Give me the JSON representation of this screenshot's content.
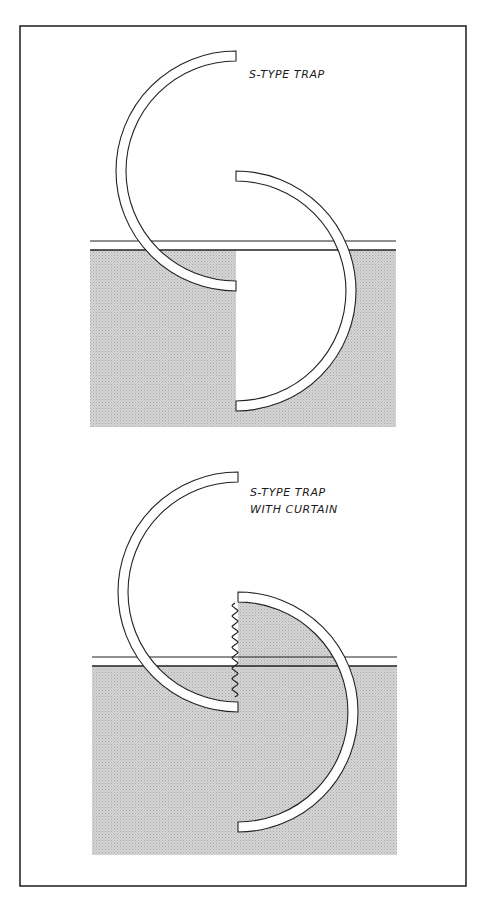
{
  "figure": {
    "frame": {
      "x": 20,
      "y": 26,
      "width": 446,
      "height": 860,
      "stroke": "#2a2a2a"
    },
    "colors": {
      "ink": "#222222",
      "soil_fill": "#d3d3d3",
      "soil_dot": "#a8a8a8",
      "pipe_fill": "#ffffff",
      "background": "#ffffff"
    },
    "panels": [
      {
        "id": "s-type-trap",
        "label_lines": [
          "S-TYPE TRAP"
        ],
        "label_pos": {
          "x": 249,
          "y": 66
        },
        "upper_arc": {
          "cx": 236,
          "cy": 171,
          "r_outer": 120,
          "r_inner": 110
        },
        "lower_arc": {
          "cx": 236,
          "cy": 291,
          "r_outer": 120,
          "r_inner": 110
        },
        "ground": {
          "line_y": 241,
          "soil_top": 250,
          "soil_bottom": 427,
          "left": 90,
          "right": 396
        },
        "curtain": false
      },
      {
        "id": "s-type-trap-with-curtain",
        "label_lines": [
          "S-TYPE TRAP",
          "WITH CURTAIN"
        ],
        "label_pos": {
          "x": 250,
          "y": 484
        },
        "upper_arc": {
          "cx": 238,
          "cy": 592,
          "r_outer": 120,
          "r_inner": 110
        },
        "lower_arc": {
          "cx": 238,
          "cy": 712,
          "r_outer": 120,
          "r_inner": 110
        },
        "ground": {
          "line_y": 657,
          "soil_top": 666,
          "soil_bottom": 855,
          "left": 92,
          "right": 397
        },
        "curtain": {
          "x": 235,
          "y_top": 603,
          "y_bottom": 697,
          "waves": 9,
          "amplitude": 3
        }
      }
    ]
  }
}
